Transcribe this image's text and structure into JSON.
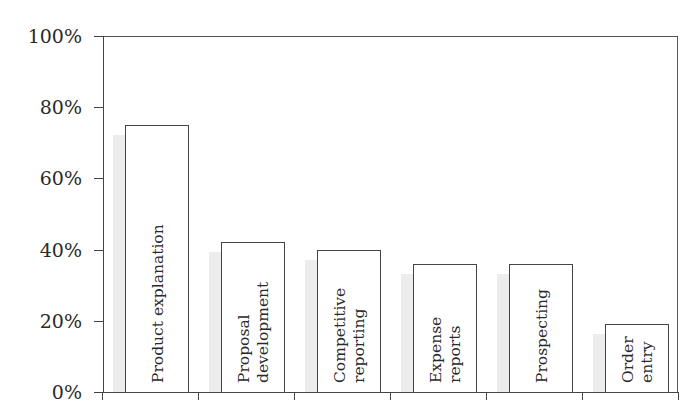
{
  "chart_data": {
    "type": "bar",
    "title": "",
    "xlabel": "",
    "ylabel": "",
    "ylim": [
      0,
      100
    ],
    "y_ticks": [
      "0%",
      "20%",
      "40%",
      "60%",
      "80%",
      "100%"
    ],
    "grid": false,
    "legend": null,
    "categories": [
      "Product explanation",
      "Proposal development",
      "Competitive reporting",
      "Expense reports",
      "Prospecting",
      "Order entry"
    ],
    "category_label_lines": [
      [
        "Product explanation"
      ],
      [
        "Proposal",
        "development"
      ],
      [
        "Competitive",
        "reporting"
      ],
      [
        "Expense",
        "reports"
      ],
      [
        "Prospecting"
      ],
      [
        "Order",
        "entry"
      ]
    ],
    "values": [
      75,
      42,
      40,
      36,
      36,
      19
    ],
    "labels_inside_bars_rotated": true
  },
  "colors": {
    "bar_fill": "#ffffff",
    "bar_border": "#444444",
    "shadow": "#ececec",
    "axis": "#444444",
    "text": "#2a2a2a"
  }
}
